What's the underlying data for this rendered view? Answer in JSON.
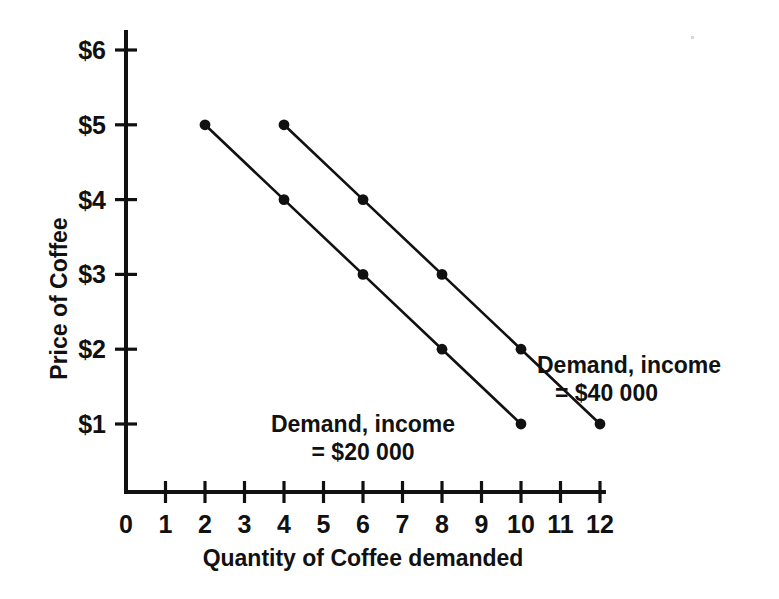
{
  "chart_data": {
    "type": "line",
    "title": "",
    "xlabel": "Quantity of Coffee demanded",
    "ylabel": "Price of Coffee",
    "xlim": [
      0,
      12
    ],
    "ylim": [
      0,
      6
    ],
    "grid": false,
    "legend_position": "inline-annotation",
    "x_tick_labels": [
      "0",
      "1",
      "2",
      "3",
      "4",
      "5",
      "6",
      "7",
      "8",
      "9",
      "10",
      "11",
      "12"
    ],
    "x_tick_values": [
      0,
      1,
      2,
      3,
      4,
      5,
      6,
      7,
      8,
      9,
      10,
      11,
      12
    ],
    "y_tick_labels": [
      "$1",
      "$2",
      "$3",
      "$4",
      "$5",
      "$6"
    ],
    "y_tick_values": [
      1,
      2,
      3,
      4,
      5,
      6
    ],
    "series": [
      {
        "name": "Demand, income = $20 000",
        "label_line1": "Demand, income",
        "label_line2": "= $20 000",
        "x": [
          2,
          4,
          6,
          8,
          10
        ],
        "values": [
          5,
          4,
          3,
          2,
          1
        ],
        "color": "#111111",
        "marker": "filled-circle"
      },
      {
        "name": "Demand, income = $40 000",
        "label_line1": "Demand, income",
        "label_line2": "= $40 000",
        "x": [
          4,
          6,
          8,
          10,
          12
        ],
        "values": [
          5,
          4,
          3,
          2,
          1
        ],
        "color": "#111111",
        "marker": "filled-circle"
      }
    ]
  },
  "axes": {
    "y_title": "Price of Coffee",
    "x_title": "Quantity of Coffee demanded"
  },
  "annotations": {
    "low_income": {
      "line1": "Demand, income",
      "line2": "= $20 000"
    },
    "high_income": {
      "line1": "Demand, income",
      "line2": "= $40 000"
    }
  },
  "style": {
    "ink_color": "#111111",
    "background": "#ffffff"
  }
}
